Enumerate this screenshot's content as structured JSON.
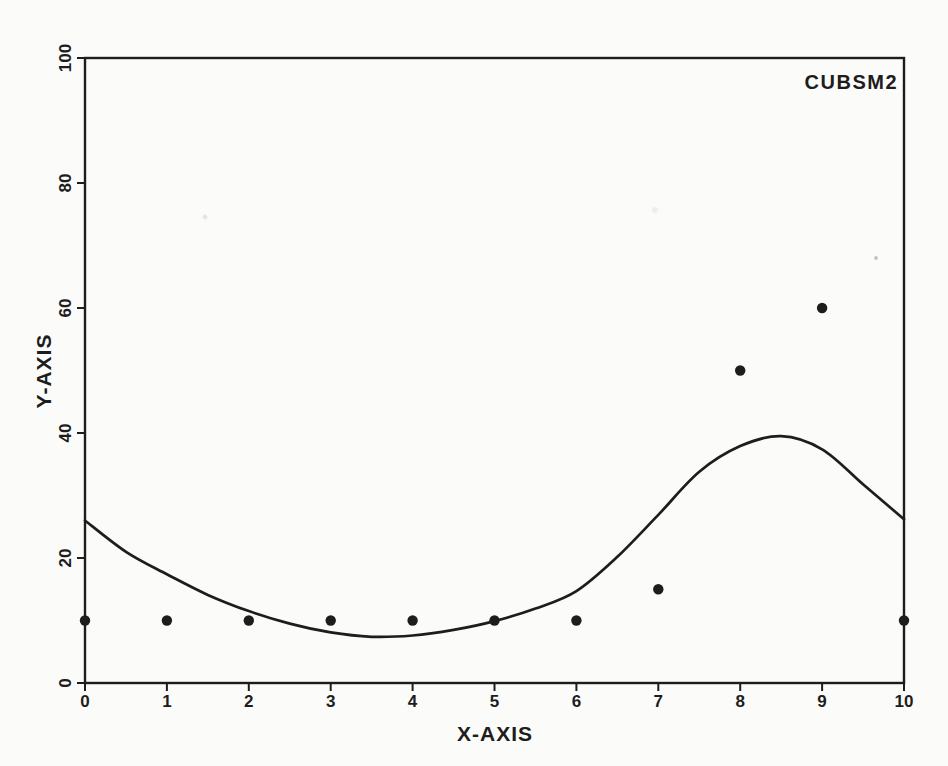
{
  "figure": {
    "annotation_label": "CUBSM2",
    "paper_color": "#fbfbf9",
    "ink_color": "#1d1d1d"
  },
  "chart_data": {
    "type": "scatter",
    "title": "CUBSM2",
    "xlabel": "X-AXIS",
    "ylabel": "Y-AXIS",
    "xlim": [
      0,
      10
    ],
    "ylim": [
      0,
      100
    ],
    "x_ticks": [
      0,
      1,
      2,
      3,
      4,
      5,
      6,
      7,
      8,
      9,
      10
    ],
    "y_ticks": [
      0,
      20,
      40,
      60,
      80,
      100
    ],
    "grid": false,
    "legend": "none",
    "marker_color": "#1d1d1d",
    "line_color": "#1d1d1d",
    "series": [
      {
        "name": "observed-points",
        "type": "scatter",
        "x": [
          0,
          1,
          2,
          3,
          4,
          5,
          6,
          7,
          8,
          9,
          10
        ],
        "y": [
          10,
          10,
          10,
          10,
          10,
          10,
          10,
          15,
          50,
          60,
          10
        ]
      },
      {
        "name": "cubic-smoothing-spline-fit",
        "type": "line",
        "points": [
          [
            0,
            26.0
          ],
          [
            0.5,
            21.0
          ],
          [
            1,
            17.4
          ],
          [
            1.5,
            14.1
          ],
          [
            2,
            11.5
          ],
          [
            2.5,
            9.5
          ],
          [
            3,
            8.1
          ],
          [
            3.5,
            7.4
          ],
          [
            4,
            7.6
          ],
          [
            4.5,
            8.5
          ],
          [
            5,
            9.9
          ],
          [
            5.5,
            11.9
          ],
          [
            6,
            14.7
          ],
          [
            6.5,
            20.2
          ],
          [
            7,
            26.9
          ],
          [
            7.5,
            33.8
          ],
          [
            8,
            37.9
          ],
          [
            8.5,
            39.5
          ],
          [
            9,
            37.4
          ],
          [
            9.5,
            31.8
          ],
          [
            10,
            26.2
          ]
        ]
      }
    ]
  }
}
